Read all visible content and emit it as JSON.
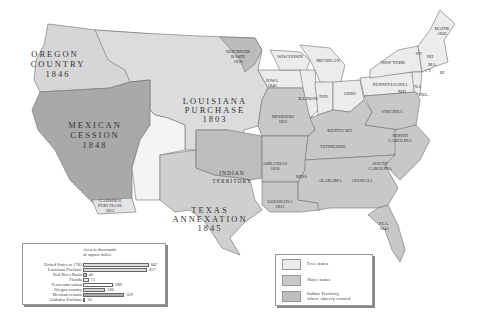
{
  "colors": {
    "free": "#ececec",
    "slave": "#c8c8c8",
    "indian_territory": "#bdbdbd",
    "territory_oregon": "#d6d6d6",
    "territory_louisiana": "#dcdcdc",
    "territory_mexican": "#a9a9a9",
    "territory_texas": "#cfcfcf",
    "territory_gadsden": "#e4e4e4",
    "territory_redriver": "#bcbcbc",
    "unorganized": "#f4f4f4",
    "border": "#6f6f6f"
  },
  "regions": {
    "oregon": {
      "name": "OREGON",
      "name2": "COUNTRY",
      "year": "1846"
    },
    "louisiana": {
      "name": "LOUISIANA",
      "name2": "PURCHASE",
      "year": "1803"
    },
    "mexican": {
      "name": "MEXICAN",
      "name2": "CESSION",
      "year": "1848"
    },
    "texas": {
      "name": "TEXAS",
      "name2": "ANNEXATION",
      "year": "1845"
    },
    "indian": {
      "name": "INDIAN",
      "name2": "TERRITORY"
    },
    "gadsden": {
      "name": "GADSDEN",
      "name2": "PURCHASE",
      "year": "1853"
    },
    "redriver": {
      "name": "RED RIVER",
      "name2": "BASIN",
      "year": "1818"
    }
  },
  "states": [
    {
      "name": "MAINE",
      "year": "1820"
    },
    {
      "name": "VT."
    },
    {
      "name": "NH"
    },
    {
      "name": "MA"
    },
    {
      "name": "CT"
    },
    {
      "name": "RI"
    },
    {
      "name": "NEW YORK"
    },
    {
      "name": "PENNSYLVANIA"
    },
    {
      "name": "N.J."
    },
    {
      "name": "DEL."
    },
    {
      "name": "MD"
    },
    {
      "name": "OHIO"
    },
    {
      "name": "IND."
    },
    {
      "name": "ILLINOIS"
    },
    {
      "name": "MICHIGAN"
    },
    {
      "name": "WISCONSIN"
    },
    {
      "name": "IOWA",
      "year": "1846"
    },
    {
      "name": "MISSOURI",
      "year": "1821"
    },
    {
      "name": "ARKANSAS",
      "year": "1836"
    },
    {
      "name": "LOUISIANA",
      "year": "1812"
    },
    {
      "name": "MISS."
    },
    {
      "name": "ALABAMA"
    },
    {
      "name": "GEORGIA"
    },
    {
      "name": "TENNESSEE"
    },
    {
      "name": "KENTUCKY"
    },
    {
      "name": "VIRGINIA"
    },
    {
      "name": "NORTH",
      "name2": "CAROLINA"
    },
    {
      "name": "SOUTH",
      "name2": "CAROLINA"
    },
    {
      "name": "FLA.",
      "year": "1845"
    }
  ],
  "legend": {
    "items": [
      {
        "label": "Free states",
        "color": "#ececec"
      },
      {
        "label": "Slave states",
        "color": "#c8c8c8"
      },
      {
        "label": "Indian Territory,",
        "label2": "where slavery existed",
        "color": "#bdbdbd"
      }
    ]
  },
  "chart_data": {
    "type": "bar",
    "title": "Area in thousands",
    "title2": "of square miles",
    "categories": [
      "United States in 1783",
      "Louisiana Purchase",
      "Red River Basin",
      "Florida",
      "Texas annexation",
      "Oregon country",
      "Mexican cession",
      "Gadsden Purchase"
    ],
    "values": [
      847,
      827,
      46,
      72,
      389,
      286,
      529,
      30
    ],
    "xlim": [
      0,
      900
    ],
    "bar_colors": [
      "#dcdcdc",
      "#dcdcdc",
      "#bcbcbc",
      "#f0f0f0",
      "#ffffff",
      "#d6d6d6",
      "#a9a9a9",
      "#e4e4e4"
    ],
    "value_labels": [
      "847",
      "827",
      "46",
      "72",
      "389",
      "286",
      "529",
      "30"
    ]
  }
}
